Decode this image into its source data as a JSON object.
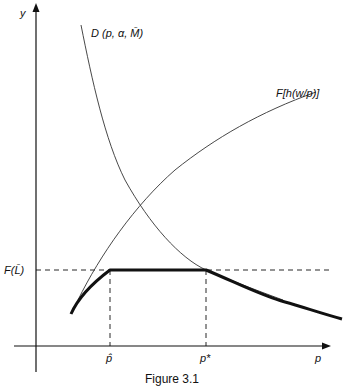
{
  "figure": {
    "caption": "Figure 3.1",
    "axes": {
      "y_label": "y",
      "x_label": "p"
    },
    "curves": {
      "demand_label": "D (p, α, M̄)",
      "production_label": "F[h(w/p)]",
      "constraint_label": "F(L̄)"
    },
    "x_ticks": {
      "p_hat": "p̂",
      "p_star": "p*"
    },
    "colors": {
      "line": "#111111",
      "thin_curve": "#333333",
      "background": "#ffffff"
    }
  }
}
